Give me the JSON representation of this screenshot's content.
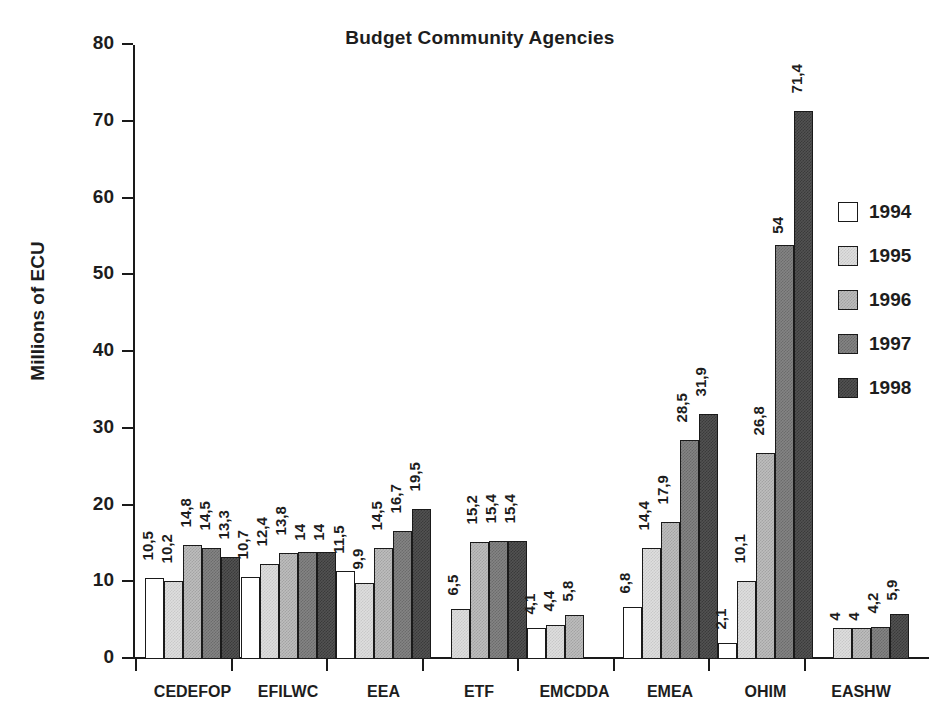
{
  "chart_data": {
    "type": "bar",
    "title": "Budget Community Agencies",
    "xlabel": "",
    "ylabel": "Millions of ECU",
    "ylim": [
      0,
      80
    ],
    "yticks": [
      0,
      10,
      20,
      30,
      40,
      50,
      60,
      70,
      80
    ],
    "grid": false,
    "legend_position": "right",
    "decimal_separator": ",",
    "categories": [
      "CEDEFOP",
      "EFILWC",
      "EEA",
      "ETF",
      "EMCDDA",
      "EMEA",
      "OHIM",
      "EASHW"
    ],
    "series": [
      {
        "name": "1994",
        "color": "#ffffff",
        "values": [
          10.5,
          10.7,
          11.5,
          null,
          4.1,
          6.8,
          2.1,
          null
        ],
        "labels": [
          "10,5",
          "10,7",
          "11,5",
          "",
          "4,1",
          "6,8",
          "2,1",
          ""
        ]
      },
      {
        "name": "1995",
        "color": "#dedede",
        "values": [
          10.2,
          12.4,
          9.9,
          6.5,
          4.4,
          14.4,
          10.1,
          4
        ],
        "labels": [
          "10,2",
          "12,4",
          "9,9",
          "6,5",
          "4,4",
          "14,4",
          "10,1",
          "4"
        ]
      },
      {
        "name": "1996",
        "color": "#bdbdbd",
        "values": [
          14.8,
          13.8,
          14.5,
          15.2,
          5.8,
          17.9,
          26.8,
          4
        ],
        "labels": [
          "14,8",
          "13,8",
          "14,5",
          "15,2",
          "5,8",
          "17,9",
          "26,8",
          "4"
        ]
      },
      {
        "name": "1997",
        "color": "#848484",
        "values": [
          14.5,
          14,
          16.7,
          15.4,
          null,
          28.5,
          54,
          4.2
        ],
        "labels": [
          "14,5",
          "14",
          "16,7",
          "15,4",
          "",
          "28,5",
          "54",
          "4,2"
        ]
      },
      {
        "name": "1998",
        "color": "#525252",
        "values": [
          13.3,
          14,
          19.5,
          15.4,
          null,
          31.9,
          71.4,
          5.9
        ],
        "labels": [
          "13,3",
          "14",
          "19,5",
          "15,4",
          "",
          "31,9",
          "71,4",
          "5,9"
        ]
      }
    ]
  },
  "legend": {
    "entries": [
      {
        "label": "1994",
        "swatch": "white-swatch"
      },
      {
        "label": "1995",
        "swatch": "light-gray-swatch"
      },
      {
        "label": "1996",
        "swatch": "medium-gray-swatch"
      },
      {
        "label": "1997",
        "swatch": "dark-gray-swatch"
      },
      {
        "label": "1998",
        "swatch": "darkest-gray-swatch"
      }
    ]
  },
  "colors": {
    "axis": "#1a1a1a",
    "text": "#1d1d1d",
    "background": "#ffffff"
  }
}
